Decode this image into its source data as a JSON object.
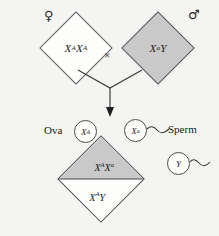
{
  "diagram": {
    "background_color": "#f4f4f2",
    "outline_color": "#5a5a5a",
    "shaded_fill": "#c9c9c9",
    "unshaded_fill": "#fdfdfc"
  },
  "parents": {
    "female": {
      "sex_symbol": "♀",
      "sex_symbol_name": "venus-symbol",
      "genotype_main": "X",
      "genotype_sup1": "A",
      "genotype_mid": "X",
      "genotype_sup2": "A",
      "fill": "unshaded"
    },
    "male": {
      "sex_symbol": "♂",
      "sex_symbol_name": "mars-symbol",
      "genotype_main": "X",
      "genotype_sup1": "a",
      "genotype_tail": "Y",
      "fill": "shaded"
    },
    "cross_symbol": "×"
  },
  "gametes": {
    "ova_label": "Ova",
    "sperm_label": "Sperm",
    "ovum": {
      "letter": "X",
      "superscript": "A"
    },
    "sperm_xa": {
      "letter": "X",
      "superscript": "a"
    },
    "sperm_y": {
      "letter": "Y",
      "superscript": ""
    }
  },
  "offspring": {
    "carrier_daughter": {
      "letter1": "X",
      "sup1": "A",
      "letter2": "X",
      "sup2": "a",
      "fill": "shaded"
    },
    "normal_son": {
      "letter1": "X",
      "sup1": "A",
      "letter2": "Y",
      "fill": "unshaded"
    }
  }
}
